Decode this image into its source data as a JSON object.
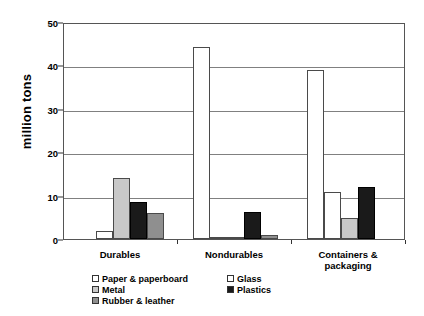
{
  "chart_data": {
    "type": "bar",
    "title": "",
    "subtitle": "",
    "xlabel": "",
    "ylabel": "million tons",
    "ylim": [
      0,
      50
    ],
    "yticks": [
      0,
      10,
      20,
      30,
      40,
      50
    ],
    "ytick_labels": [
      "0",
      "10",
      "20",
      "30",
      "40",
      "50"
    ],
    "grid": true,
    "legend_position": "bottom",
    "categories": [
      "Durables",
      "Nondurables",
      "Containers &\npackaging"
    ],
    "series": [
      {
        "name": "Paper & paperboard",
        "color": "#ffffff",
        "pattern": "solid",
        "values": [
          0,
          44.3,
          38.9
        ]
      },
      {
        "name": "Glass",
        "color": "#ffffff",
        "pattern": "dotted",
        "values": [
          1.8,
          0.2,
          10.8
        ]
      },
      {
        "name": "Metal",
        "color": "#c8c8c8",
        "pattern": "solid",
        "values": [
          14.0,
          0.3,
          4.9
        ]
      },
      {
        "name": "Plastics",
        "color": "#1a1a1a",
        "pattern": "solid",
        "values": [
          8.5,
          6.3,
          12.0
        ]
      },
      {
        "name": "Rubber & leather",
        "color": "#8f8f8f",
        "pattern": "solid",
        "values": [
          6.0,
          1.0,
          0
        ]
      }
    ]
  },
  "legend": {
    "left_column": [
      {
        "label": "Paper & paperboard",
        "swatch": "paper-swatch"
      },
      {
        "label": "Metal",
        "swatch": "metal-swatch"
      },
      {
        "label": "Rubber & leather",
        "swatch": "rubber-swatch"
      }
    ],
    "right_column": [
      {
        "label": "Glass",
        "swatch": "glass-swatch"
      },
      {
        "label": "Plastics",
        "swatch": "plastics-swatch"
      }
    ]
  }
}
